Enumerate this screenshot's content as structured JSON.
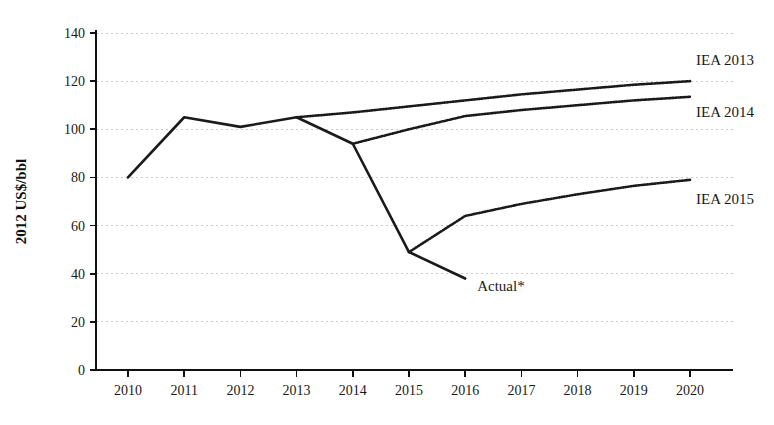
{
  "chart_data": {
    "type": "line",
    "title": "",
    "subtitle": "",
    "xlabel": "",
    "ylabel": "2012 US$/bbl",
    "xlim": [
      2010,
      2020
    ],
    "ylim": [
      0,
      140
    ],
    "grid": true,
    "grid_axis": "y",
    "legend_position": "inline-right-of-line-ends",
    "categories": [
      2010,
      2011,
      2012,
      2013,
      2014,
      2015,
      2016,
      2017,
      2018,
      2019,
      2020
    ],
    "xtick_labels": [
      "2010",
      "2011",
      "2012",
      "2013",
      "2014",
      "2015",
      "2016",
      "2017",
      "2018",
      "2019",
      "2020"
    ],
    "ytick_labels": [
      "0",
      "20",
      "40",
      "60",
      "80",
      "100",
      "120",
      "140"
    ],
    "yticks": [
      0,
      20,
      40,
      60,
      80,
      100,
      120,
      140
    ],
    "series": [
      {
        "name": "Actual*",
        "label": "Actual*",
        "style": "solid",
        "color": "#1a1a1a",
        "x": [
          2010,
          2011,
          2012,
          2013,
          2014,
          2015,
          2016
        ],
        "values": [
          80,
          105,
          101,
          105,
          94,
          49,
          38
        ]
      },
      {
        "name": "IEA 2013",
        "label": "IEA 2013",
        "style": "dotted",
        "color": "#1a1a1a",
        "x": [
          2013,
          2014,
          2015,
          2016,
          2017,
          2018,
          2019,
          2020
        ],
        "values": [
          105,
          107,
          109.5,
          112,
          114.5,
          116.5,
          118.5,
          120
        ]
      },
      {
        "name": "IEA 2014",
        "label": "IEA 2014",
        "style": "dotted",
        "color": "#1a1a1a",
        "x": [
          2014,
          2015,
          2016,
          2017,
          2018,
          2019,
          2020
        ],
        "values": [
          94,
          100,
          105.5,
          108,
          110,
          112,
          113.5
        ]
      },
      {
        "name": "IEA 2015",
        "label": "IEA 2015",
        "style": "dotted",
        "color": "#1a1a1a",
        "x": [
          2015,
          2016,
          2017,
          2018,
          2019,
          2020
        ],
        "values": [
          49,
          64,
          69,
          73,
          76.5,
          79
        ]
      }
    ],
    "annotations": [
      {
        "text": "Actual*",
        "x": 2016,
        "y": 38,
        "placement": "right-of-endpoint"
      },
      {
        "text": "IEA 2013",
        "x": 2020,
        "y": 120,
        "placement": "above-endpoint"
      },
      {
        "text": "IEA 2014",
        "x": 2020,
        "y": 113.5,
        "placement": "below-endpoint"
      },
      {
        "text": "IEA 2015",
        "x": 2020,
        "y": 79,
        "placement": "below-endpoint"
      }
    ]
  }
}
